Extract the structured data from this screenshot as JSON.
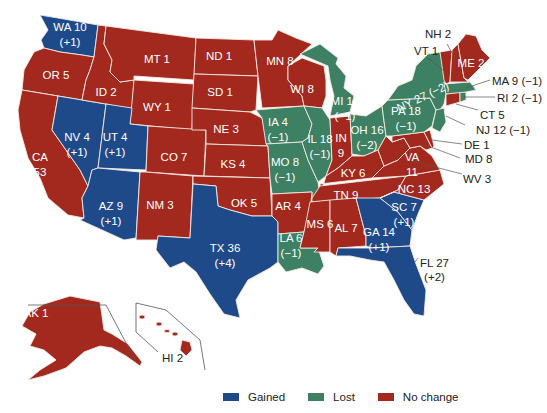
{
  "colors": {
    "gained": "#1f4a8a",
    "lost": "#3d8063",
    "no_change": "#a3291f",
    "border": "#f3e9e2",
    "leader": "#555555",
    "background": "#ffffff"
  },
  "legend": [
    {
      "key": "gained",
      "label": "Gained",
      "color": "#1f4a8a"
    },
    {
      "key": "lost",
      "label": "Lost",
      "color": "#3d8063"
    },
    {
      "key": "no_change",
      "label": "No change",
      "color": "#a3291f"
    }
  ],
  "states": {
    "WA": {
      "abbr": "WA",
      "seats": "10",
      "change": "(+1)",
      "status": "gained",
      "label": "WA 10",
      "sub": "(+1)"
    },
    "OR": {
      "abbr": "OR",
      "seats": "5",
      "status": "no_change",
      "label": "OR 5"
    },
    "CA": {
      "abbr": "CA",
      "seats": "53",
      "status": "no_change",
      "label": "CA",
      "sub": "53"
    },
    "NV": {
      "abbr": "NV",
      "seats": "4",
      "change": "(+1)",
      "status": "gained",
      "label": "NV 4",
      "sub": "(+1)"
    },
    "ID": {
      "abbr": "ID",
      "seats": "2",
      "status": "no_change",
      "label": "ID 2"
    },
    "MT": {
      "abbr": "MT",
      "seats": "1",
      "status": "no_change",
      "label": "MT 1"
    },
    "WY": {
      "abbr": "WY",
      "seats": "1",
      "status": "no_change",
      "label": "WY 1"
    },
    "UT": {
      "abbr": "UT",
      "seats": "4",
      "change": "(+1)",
      "status": "gained",
      "label": "UT 4",
      "sub": "(+1)"
    },
    "AZ": {
      "abbr": "AZ",
      "seats": "9",
      "change": "(+1)",
      "status": "gained",
      "label": "AZ 9",
      "sub": "(+1)"
    },
    "CO": {
      "abbr": "CO",
      "seats": "7",
      "status": "no_change",
      "label": "CO 7"
    },
    "NM": {
      "abbr": "NM",
      "seats": "3",
      "status": "no_change",
      "label": "NM 3"
    },
    "ND": {
      "abbr": "ND",
      "seats": "1",
      "status": "no_change",
      "label": "ND 1"
    },
    "SD": {
      "abbr": "SD",
      "seats": "1",
      "status": "no_change",
      "label": "SD 1"
    },
    "NE": {
      "abbr": "NE",
      "seats": "3",
      "status": "no_change",
      "label": "NE 3"
    },
    "KS": {
      "abbr": "KS",
      "seats": "4",
      "status": "no_change",
      "label": "KS 4"
    },
    "OK": {
      "abbr": "OK",
      "seats": "5",
      "status": "no_change",
      "label": "OK 5"
    },
    "TX": {
      "abbr": "TX",
      "seats": "36",
      "change": "(+4)",
      "status": "gained",
      "label": "TX 36",
      "sub": "(+4)"
    },
    "MN": {
      "abbr": "MN",
      "seats": "8",
      "status": "no_change",
      "label": "MN 8"
    },
    "IA": {
      "abbr": "IA",
      "seats": "4",
      "change": "(−1)",
      "status": "lost",
      "label": "IA 4",
      "sub": "(−1)"
    },
    "MO": {
      "abbr": "MO",
      "seats": "8",
      "change": "(−1)",
      "status": "lost",
      "label": "MO 8",
      "sub": "(−1)"
    },
    "AR": {
      "abbr": "AR",
      "seats": "4",
      "status": "no_change",
      "label": "AR 4"
    },
    "LA": {
      "abbr": "LA",
      "seats": "6",
      "change": "(−1)",
      "status": "lost",
      "label": "LA 6",
      "sub": "(−1)"
    },
    "WI": {
      "abbr": "WI",
      "seats": "8",
      "status": "no_change",
      "label": "WI 8"
    },
    "IL": {
      "abbr": "IL",
      "seats": "18",
      "change": "(−1)",
      "status": "lost",
      "label": "IL 18",
      "sub": "(−1)"
    },
    "MI": {
      "abbr": "MI",
      "seats": "14",
      "change": "(−1)",
      "status": "lost",
      "label": "MI 14",
      "sub": "(−1)"
    },
    "IN": {
      "abbr": "IN",
      "seats": "9",
      "status": "no_change",
      "label": "IN",
      "sub": "9"
    },
    "OH": {
      "abbr": "OH",
      "seats": "16",
      "change": "(−2)",
      "status": "lost",
      "label": "OH 16",
      "sub": "(−2)"
    },
    "KY": {
      "abbr": "KY",
      "seats": "6",
      "status": "no_change",
      "label": "KY 6"
    },
    "TN": {
      "abbr": "TN",
      "seats": "9",
      "status": "no_change",
      "label": "TN 9"
    },
    "MS": {
      "abbr": "MS",
      "seats": "6",
      "status": "no_change",
      "label": "MS 6"
    },
    "AL": {
      "abbr": "AL",
      "seats": "7",
      "status": "no_change",
      "label": "AL 7"
    },
    "GA": {
      "abbr": "GA",
      "seats": "14",
      "change": "(+1)",
      "status": "gained",
      "label": "GA 14",
      "sub": "(+1)"
    },
    "FL": {
      "abbr": "FL",
      "seats": "27",
      "change": "(+2)",
      "status": "gained",
      "label": "FL 27",
      "sub": "(+2)"
    },
    "SC": {
      "abbr": "SC",
      "seats": "7",
      "change": "(+1)",
      "status": "gained",
      "label": "SC 7",
      "sub": "(+1)"
    },
    "NC": {
      "abbr": "NC",
      "seats": "13",
      "status": "no_change",
      "label": "NC 13"
    },
    "VA": {
      "abbr": "VA",
      "seats": "11",
      "status": "no_change",
      "label": "VA",
      "sub": "11"
    },
    "WV": {
      "abbr": "WV",
      "seats": "3",
      "status": "no_change",
      "label": "WV 3"
    },
    "PA": {
      "abbr": "PA",
      "seats": "18",
      "change": "(−1)",
      "status": "lost",
      "label": "PA 18",
      "sub": "(−1)"
    },
    "NY": {
      "abbr": "NY",
      "seats": "27",
      "change": "(−2)",
      "status": "lost",
      "label": "NY 27 (−2)"
    },
    "MD": {
      "abbr": "MD",
      "seats": "8",
      "status": "no_change",
      "label": "MD 8"
    },
    "DE": {
      "abbr": "DE",
      "seats": "1",
      "status": "no_change",
      "label": "DE 1"
    },
    "NJ": {
      "abbr": "NJ",
      "seats": "12",
      "change": "(−1)",
      "status": "lost",
      "label": "NJ 12 (−1)"
    },
    "CT": {
      "abbr": "CT",
      "seats": "5",
      "status": "no_change",
      "label": "CT 5"
    },
    "RI": {
      "abbr": "RI",
      "seats": "2",
      "change": "(−1)",
      "status": "lost",
      "label": "RI 2 (−1)"
    },
    "MA": {
      "abbr": "MA",
      "seats": "9",
      "change": "(−1)",
      "status": "lost",
      "label": "MA 9 (−1)"
    },
    "VT": {
      "abbr": "VT",
      "seats": "1",
      "status": "no_change",
      "label": "VT 1"
    },
    "NH": {
      "abbr": "NH",
      "seats": "2",
      "status": "no_change",
      "label": "NH 2"
    },
    "ME": {
      "abbr": "ME",
      "seats": "2",
      "status": "no_change",
      "label": "ME 2"
    },
    "AK": {
      "abbr": "AK",
      "seats": "1",
      "status": "no_change",
      "label": "AK 1"
    },
    "HI": {
      "abbr": "HI",
      "seats": "2",
      "status": "no_change",
      "label": "HI 2"
    }
  }
}
